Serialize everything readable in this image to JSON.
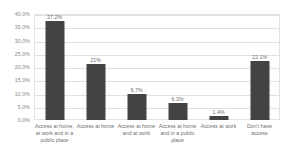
{
  "chart_data": {
    "type": "bar",
    "title": "",
    "subtitle": "",
    "xlabel": "",
    "ylabel": "",
    "ylim": [
      0,
      40
    ],
    "grid": true,
    "legend": false,
    "legend_position": "none",
    "bar_color": "#434343",
    "gridline_color": "#e0e0e0",
    "plot_border_color": "#e3e3e3",
    "label_color": "#6d6d6d",
    "decimal_separator": ",",
    "categories": [
      "Access at home, at work and in a public place",
      "Access at home",
      "Access at home and at work",
      "Access at home and in a public place",
      "Access at work",
      "Don't have access"
    ],
    "values": [
      37.2,
      21.0,
      9.7,
      6.3,
      1.4,
      22.1
    ],
    "data_labels": [
      "37,2%",
      "21%",
      "9,7%",
      "6,3%",
      "1,4%",
      "22,1%"
    ],
    "y_ticks": [
      0,
      5,
      10,
      15,
      20,
      25,
      30,
      35,
      40
    ],
    "y_tick_labels": [
      "0,0%",
      "5,0%",
      "10,0%",
      "15,0%",
      "20,0%",
      "25,0%",
      "30,0%",
      "35,0%",
      "40,0%"
    ]
  }
}
